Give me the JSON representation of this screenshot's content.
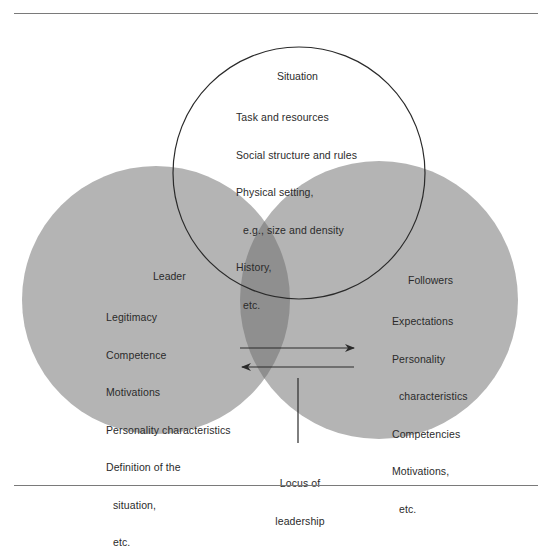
{
  "diagram": {
    "type": "venn",
    "colors": {
      "circle_fill": "#b4b4b4",
      "overlap_fill": "#8f8f8f",
      "outline": "#2a2a2a",
      "rule": "#7a7a7a",
      "text": "#2b2b2b"
    },
    "situation": {
      "title": "Situation",
      "items": [
        {
          "text": "Task and resources",
          "indent": false
        },
        {
          "text": "Social structure and rules",
          "indent": false
        },
        {
          "text": "Physical setting,",
          "indent": false
        },
        {
          "text": "e.g., size and density",
          "indent": true
        },
        {
          "text": "History,",
          "indent": false
        },
        {
          "text": "etc.",
          "indent": true
        }
      ]
    },
    "leader": {
      "title": "Leader",
      "items": [
        {
          "text": "Legitimacy",
          "indent": false
        },
        {
          "text": "Competence",
          "indent": false
        },
        {
          "text": "Motivations",
          "indent": false
        },
        {
          "text": "Personality characteristics",
          "indent": false
        },
        {
          "text": "Definition of the",
          "indent": false
        },
        {
          "text": "situation,",
          "indent": true
        },
        {
          "text": "etc.",
          "indent": true
        }
      ]
    },
    "followers": {
      "title": "Followers",
      "items": [
        {
          "text": "Expectations",
          "indent": false
        },
        {
          "text": "Personality",
          "indent": false
        },
        {
          "text": "characteristics",
          "indent": true
        },
        {
          "text": "Competencies",
          "indent": false
        },
        {
          "text": "Motivations,",
          "indent": false
        },
        {
          "text": "etc.",
          "indent": true
        }
      ]
    },
    "locus": {
      "line1": "Locus of",
      "line2": "leadership"
    },
    "arrows": [
      {
        "direction": "right",
        "from": "leader",
        "to": "followers"
      },
      {
        "direction": "left",
        "from": "followers",
        "to": "leader"
      }
    ]
  }
}
